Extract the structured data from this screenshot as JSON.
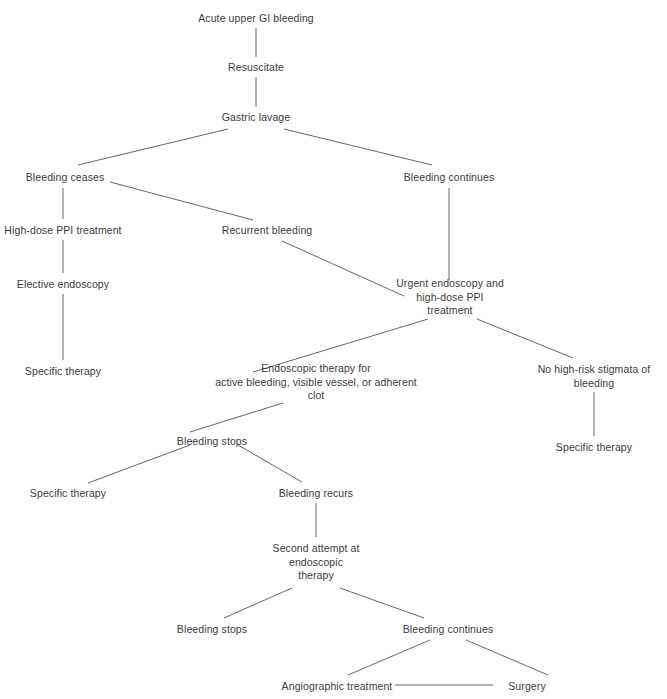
{
  "diagram": {
    "type": "flowchart",
    "background_color": "#ffffff",
    "text_color": "#3b3b3b",
    "edge_color": "#555555",
    "nodes": [
      {
        "id": "n1",
        "label": "Acute upper GI bleeding",
        "x": 256,
        "y": 12,
        "width": 170
      },
      {
        "id": "n2",
        "label": "Resuscitate",
        "x": 256,
        "y": 61,
        "width": 120
      },
      {
        "id": "n3",
        "label": "Gastric lavage",
        "x": 256,
        "y": 111,
        "width": 130
      },
      {
        "id": "n4",
        "label": "Bleeding ceases",
        "x": 65,
        "y": 171,
        "width": 130
      },
      {
        "id": "n5",
        "label": "Bleeding continues",
        "x": 449,
        "y": 171,
        "width": 140
      },
      {
        "id": "n6",
        "label": "High-dose PPI treatment",
        "x": 63,
        "y": 224,
        "width": 160
      },
      {
        "id": "n7",
        "label": "Recurrent bleeding",
        "x": 267,
        "y": 224,
        "width": 140
      },
      {
        "id": "n8",
        "label": "Elective endoscopy",
        "x": 63,
        "y": 278,
        "width": 140
      },
      {
        "id": "n9",
        "label": "Urgent endoscopy and\nhigh-dose PPI\ntreatment",
        "x": 450,
        "y": 277,
        "width": 150
      },
      {
        "id": "n10",
        "label": "Specific therapy",
        "x": 63,
        "y": 365,
        "width": 130
      },
      {
        "id": "n11",
        "label": "Endoscopic therapy for\nactive bleeding, visible vessel, or adherent\nclot",
        "x": 316,
        "y": 362,
        "width": 230
      },
      {
        "id": "n12",
        "label": "No high-risk stigmata of\nbleeding",
        "x": 594,
        "y": 363,
        "width": 150
      },
      {
        "id": "n13",
        "label": "Bleeding stops",
        "x": 212,
        "y": 435,
        "width": 120
      },
      {
        "id": "n14",
        "label": "Specific therapy",
        "x": 68,
        "y": 487,
        "width": 130
      },
      {
        "id": "n15",
        "label": "Bleeding recurs",
        "x": 316,
        "y": 487,
        "width": 120
      },
      {
        "id": "n16",
        "label": "Specific therapy",
        "x": 594,
        "y": 441,
        "width": 130
      },
      {
        "id": "n17",
        "label": "Second attempt at\nendoscopic\ntherapy",
        "x": 316,
        "y": 542,
        "width": 140
      },
      {
        "id": "n18",
        "label": "Bleeding stops",
        "x": 212,
        "y": 623,
        "width": 120
      },
      {
        "id": "n19",
        "label": "Bleeding continues",
        "x": 448,
        "y": 623,
        "width": 140
      },
      {
        "id": "n20",
        "label": "Angiographic treatment",
        "x": 337,
        "y": 680,
        "width": 160
      },
      {
        "id": "n21",
        "label": "Surgery",
        "x": 527,
        "y": 680,
        "width": 90
      }
    ],
    "edges": [
      {
        "from": "n1",
        "to": "n2",
        "x1": 256,
        "y1": 28,
        "x2": 256,
        "y2": 57
      },
      {
        "from": "n2",
        "to": "n3",
        "x1": 256,
        "y1": 77,
        "x2": 256,
        "y2": 107
      },
      {
        "from": "n3",
        "to": "n4",
        "x1": 228,
        "y1": 129,
        "x2": 78,
        "y2": 165
      },
      {
        "from": "n3",
        "to": "n5",
        "x1": 284,
        "y1": 129,
        "x2": 432,
        "y2": 165
      },
      {
        "from": "n4",
        "to": "n6",
        "x1": 63,
        "y1": 188,
        "x2": 63,
        "y2": 219
      },
      {
        "from": "n4",
        "to": "n7",
        "x1": 110,
        "y1": 182,
        "x2": 253,
        "y2": 220
      },
      {
        "from": "n5",
        "to": "n9",
        "x1": 449,
        "y1": 188,
        "x2": 449,
        "y2": 280
      },
      {
        "from": "n6",
        "to": "n8",
        "x1": 63,
        "y1": 240,
        "x2": 63,
        "y2": 273
      },
      {
        "from": "n7",
        "to": "n9",
        "x1": 282,
        "y1": 241,
        "x2": 404,
        "y2": 296
      },
      {
        "from": "n8",
        "to": "n10",
        "x1": 63,
        "y1": 294,
        "x2": 63,
        "y2": 360
      },
      {
        "from": "n9",
        "to": "n11",
        "x1": 428,
        "y1": 319,
        "x2": 253,
        "y2": 372
      },
      {
        "from": "n9",
        "to": "n12",
        "x1": 477,
        "y1": 319,
        "x2": 573,
        "y2": 358
      },
      {
        "from": "n11",
        "to": "n13",
        "x1": 283,
        "y1": 403,
        "x2": 190,
        "y2": 432
      },
      {
        "from": "n12",
        "to": "n16",
        "x1": 594,
        "y1": 392,
        "x2": 594,
        "y2": 436
      },
      {
        "from": "n13",
        "to": "n14",
        "x1": 190,
        "y1": 445,
        "x2": 88,
        "y2": 483
      },
      {
        "from": "n13",
        "to": "n15",
        "x1": 238,
        "y1": 445,
        "x2": 302,
        "y2": 482
      },
      {
        "from": "n15",
        "to": "n17",
        "x1": 316,
        "y1": 503,
        "x2": 316,
        "y2": 537
      },
      {
        "from": "n17",
        "to": "n18",
        "x1": 292,
        "y1": 588,
        "x2": 224,
        "y2": 618
      },
      {
        "from": "n17",
        "to": "n19",
        "x1": 340,
        "y1": 588,
        "x2": 424,
        "y2": 618
      },
      {
        "from": "n19",
        "to": "n20",
        "x1": 430,
        "y1": 640,
        "x2": 348,
        "y2": 675
      },
      {
        "from": "n19",
        "to": "n21",
        "x1": 466,
        "y1": 640,
        "x2": 548,
        "y2": 675
      },
      {
        "from": "n20",
        "to": "n21",
        "x1": 395,
        "y1": 685,
        "x2": 493,
        "y2": 685
      }
    ]
  }
}
